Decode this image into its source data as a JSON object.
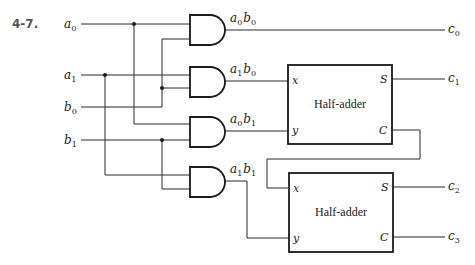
{
  "problem_number": "4-7.",
  "inputs": [
    {
      "var": "a",
      "sub": "0",
      "y": 24
    },
    {
      "var": "a",
      "sub": "1",
      "y": 75
    },
    {
      "var": "b",
      "sub": "0",
      "y": 107
    },
    {
      "var": "b",
      "sub": "1",
      "y": 140
    }
  ],
  "gates": [
    {
      "type": "AND",
      "label": [
        "a",
        "0",
        "b",
        "0"
      ]
    },
    {
      "type": "AND",
      "label": [
        "a",
        "1",
        "b",
        "0"
      ]
    },
    {
      "type": "AND",
      "label": [
        "a",
        "0",
        "b",
        "1"
      ]
    },
    {
      "type": "AND",
      "label": [
        "a",
        "1",
        "b",
        "1"
      ]
    }
  ],
  "half_adders": [
    {
      "title": "Half-adder",
      "ports": {
        "x": "x",
        "y": "y",
        "s": "S",
        "c": "C"
      }
    },
    {
      "title": "Half-adder",
      "ports": {
        "x": "x",
        "y": "y",
        "s": "S",
        "c": "C"
      }
    }
  ],
  "outputs": [
    {
      "var": "c",
      "sub": "0"
    },
    {
      "var": "c",
      "sub": "1"
    },
    {
      "var": "c",
      "sub": "2"
    },
    {
      "var": "c",
      "sub": "3"
    }
  ]
}
